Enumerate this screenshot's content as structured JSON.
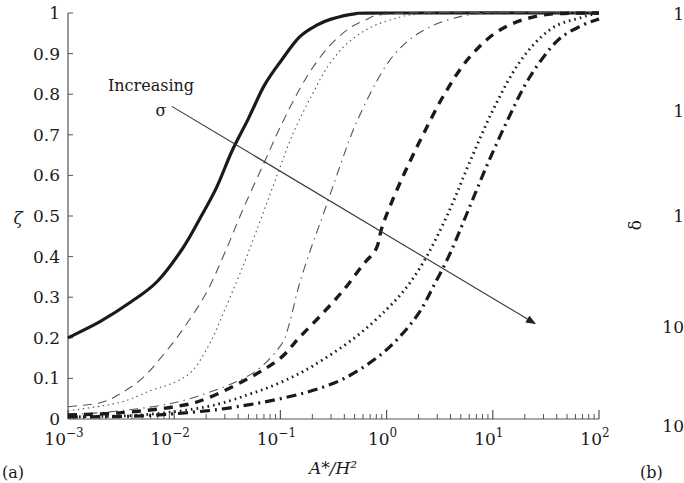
{
  "chart_data": {
    "type": "line",
    "title": "",
    "panel_label": "(a)",
    "xlabel": "A*/H²",
    "ylabel": "ζ",
    "xscale": "log",
    "xlim": [
      0.001,
      100
    ],
    "ylim": [
      0,
      1
    ],
    "grid": false,
    "legend": null,
    "x_ticks": [
      {
        "value": 0.001,
        "base": "10",
        "exp": "−3"
      },
      {
        "value": 0.01,
        "base": "10",
        "exp": "−2"
      },
      {
        "value": 0.1,
        "base": "10",
        "exp": "−1"
      },
      {
        "value": 1,
        "base": "10",
        "exp": "0"
      },
      {
        "value": 10,
        "base": "10",
        "exp": "1"
      },
      {
        "value": 100,
        "base": "10",
        "exp": "2"
      }
    ],
    "y_ticks": [
      "0",
      "0.1",
      "0.2",
      "0.3",
      "0.4",
      "0.5",
      "0.6",
      "0.7",
      "0.8",
      "0.9",
      "1"
    ],
    "annotations": [
      {
        "text_line1": "Increasing",
        "text_line2": "σ",
        "arrow_from": [
          0.0095,
          0.77
        ],
        "arrow_to": [
          25,
          0.235
        ]
      }
    ],
    "series": [
      {
        "name": "σ1 (lowest)",
        "style": "solid-thick",
        "x": [
          0.001,
          0.002,
          0.004,
          0.007,
          0.012,
          0.018,
          0.025,
          0.035,
          0.05,
          0.07,
          0.1,
          0.15,
          0.22,
          0.3,
          0.5,
          1,
          100
        ],
        "values": [
          0.2,
          0.24,
          0.29,
          0.34,
          0.42,
          0.5,
          0.57,
          0.66,
          0.74,
          0.82,
          0.88,
          0.94,
          0.97,
          0.985,
          0.998,
          1.0,
          1.0
        ]
      },
      {
        "name": "σ2",
        "style": "dashed-thin",
        "x": [
          0.001,
          0.002,
          0.003,
          0.005,
          0.008,
          0.012,
          0.02,
          0.03,
          0.045,
          0.07,
          0.1,
          0.15,
          0.22,
          0.35,
          0.6,
          1.5,
          100
        ],
        "values": [
          0.03,
          0.04,
          0.06,
          0.1,
          0.16,
          0.22,
          0.31,
          0.41,
          0.52,
          0.63,
          0.72,
          0.81,
          0.88,
          0.94,
          0.98,
          1.0,
          1.0
        ]
      },
      {
        "name": "σ3",
        "style": "dotted-thin",
        "x": [
          0.001,
          0.003,
          0.006,
          0.01,
          0.015,
          0.022,
          0.03,
          0.045,
          0.065,
          0.09,
          0.13,
          0.2,
          0.3,
          0.5,
          1,
          3,
          100
        ],
        "values": [
          0.02,
          0.04,
          0.07,
          0.09,
          0.12,
          0.19,
          0.27,
          0.38,
          0.49,
          0.59,
          0.7,
          0.8,
          0.88,
          0.94,
          0.98,
          1.0,
          1.0
        ]
      },
      {
        "name": "σ4",
        "style": "dashdot-thin",
        "x": [
          0.001,
          0.003,
          0.01,
          0.03,
          0.06,
          0.1,
          0.12,
          0.15,
          0.2,
          0.25,
          0.35,
          0.5,
          0.8,
          1.2,
          2,
          4,
          10,
          100
        ],
        "values": [
          0.01,
          0.02,
          0.04,
          0.08,
          0.12,
          0.18,
          0.23,
          0.33,
          0.43,
          0.5,
          0.61,
          0.72,
          0.83,
          0.9,
          0.95,
          0.985,
          1.0,
          1.0
        ]
      },
      {
        "name": "σ5",
        "style": "dashed-thick",
        "x": [
          0.001,
          0.003,
          0.01,
          0.02,
          0.05,
          0.1,
          0.15,
          0.25,
          0.4,
          0.6,
          0.8,
          0.9,
          1.1,
          1.5,
          2.2,
          3.5,
          6,
          12,
          30,
          100
        ],
        "values": [
          0.01,
          0.015,
          0.03,
          0.05,
          0.1,
          0.15,
          0.2,
          0.26,
          0.32,
          0.38,
          0.42,
          0.47,
          0.53,
          0.61,
          0.7,
          0.8,
          0.89,
          0.96,
          0.995,
          1.0
        ]
      },
      {
        "name": "σ6",
        "style": "dotted-thick",
        "x": [
          0.001,
          0.005,
          0.02,
          0.05,
          0.1,
          0.2,
          0.5,
          1,
          1.6,
          2.5,
          4,
          6,
          10,
          18,
          35,
          70,
          100
        ],
        "values": [
          0.005,
          0.01,
          0.03,
          0.06,
          0.09,
          0.13,
          0.2,
          0.27,
          0.33,
          0.41,
          0.52,
          0.63,
          0.76,
          0.88,
          0.96,
          0.99,
          1.0
        ]
      },
      {
        "name": "σ7 (highest)",
        "style": "dashdot-thick",
        "x": [
          0.001,
          0.005,
          0.02,
          0.05,
          0.1,
          0.2,
          0.4,
          0.8,
          1.3,
          2,
          2.8,
          4,
          6,
          9,
          14,
          22,
          40,
          70,
          100
        ],
        "values": [
          0.005,
          0.008,
          0.02,
          0.035,
          0.05,
          0.07,
          0.1,
          0.15,
          0.2,
          0.26,
          0.33,
          0.41,
          0.52,
          0.63,
          0.74,
          0.84,
          0.93,
          0.97,
          0.985
        ]
      }
    ],
    "partial_panel_b": {
      "panel_label": "(b)",
      "ylabel": "δ",
      "visible_tick_fragments": [
        "1",
        "1",
        "1",
        "10",
        "10"
      ]
    }
  }
}
